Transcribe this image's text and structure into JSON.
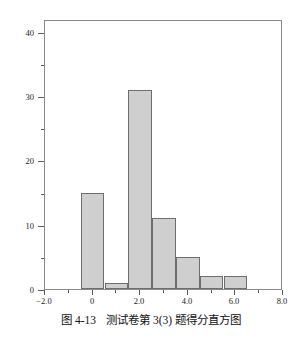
{
  "figure": {
    "caption_number": "图 4-13",
    "caption_text": "测试卷第 3(3) 题得分直方图",
    "caption_full": "图 4-13　测试卷第 3(3) 题得分直方图"
  },
  "colors": {
    "bar_fill": "#cfcfcf",
    "bar_edge": "#6e6e6e",
    "axis": "#8a8a8a",
    "text": "#1a1a1a",
    "background": "#ffffff"
  },
  "chart_data": {
    "type": "bar",
    "subtype": "histogram",
    "title": "",
    "xlabel": "",
    "ylabel": "",
    "xlim": [
      -2.0,
      8.0
    ],
    "ylim": [
      0,
      42
    ],
    "grid": false,
    "legend": null,
    "bin_width": 1.0,
    "x_tick_labels": [
      "-2.0",
      "0",
      "2.0",
      "4.0",
      "6.0",
      "8.0"
    ],
    "x_tick_values": [
      -2.0,
      0,
      2.0,
      4.0,
      6.0,
      8.0
    ],
    "x_minor_tick_values": [
      -1.0,
      1.0,
      3.0,
      5.0,
      7.0
    ],
    "y_tick_labels": [
      "0",
      "10",
      "20",
      "30",
      "40"
    ],
    "y_tick_values": [
      0,
      10,
      20,
      30,
      40
    ],
    "y_minor_tick_values": [
      5,
      15,
      25,
      35
    ],
    "bins": [
      {
        "start": -0.5,
        "end": 0.5,
        "center": 0.0,
        "value": 15
      },
      {
        "start": 0.5,
        "end": 1.5,
        "center": 1.0,
        "value": 1
      },
      {
        "start": 1.5,
        "end": 2.5,
        "center": 2.0,
        "value": 31
      },
      {
        "start": 2.5,
        "end": 3.5,
        "center": 3.0,
        "value": 11
      },
      {
        "start": 3.5,
        "end": 4.5,
        "center": 4.0,
        "value": 5
      },
      {
        "start": 4.5,
        "end": 5.5,
        "center": 5.0,
        "value": 2
      },
      {
        "start": 5.5,
        "end": 6.5,
        "center": 6.0,
        "value": 2
      }
    ],
    "categories": [
      "0",
      "1",
      "2",
      "3",
      "4",
      "5",
      "6"
    ],
    "values": [
      15,
      1,
      31,
      11,
      5,
      2,
      2
    ]
  }
}
